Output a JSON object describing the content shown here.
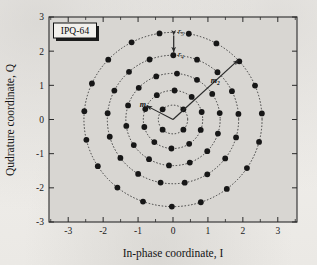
{
  "figure": {
    "badge_label": "IPQ-64",
    "axes": {
      "xlabel": "In-phase coordinate, I",
      "ylabel": "Qudrature coordinate, Q",
      "xticks": [
        -3,
        -2,
        -1,
        0,
        1,
        2,
        3
      ],
      "yticks": [
        -3,
        -2,
        -1,
        0,
        1,
        2,
        3
      ],
      "xtick_labels": [
        "-3",
        "-2",
        "-1",
        "0",
        "1",
        "2",
        "3"
      ],
      "ytick_labels": [
        "-3",
        "-2",
        "-1",
        "0",
        "1",
        "2",
        "3"
      ],
      "xlim": [
        -3.55,
        3.55
      ],
      "ylim": [
        -3.0,
        3.0
      ]
    },
    "annotations": [
      {
        "name": "r5",
        "base": "r",
        "sub": "5",
        "kind": "ring-spacing-upper"
      },
      {
        "name": "r4",
        "base": "r",
        "sub": "4",
        "kind": "ring-spacing-lower"
      },
      {
        "name": "m1",
        "base": "m",
        "sub": "1",
        "kind": "radius-vector-inner"
      },
      {
        "name": "m2",
        "base": "m",
        "sub": "2",
        "kind": "radius-vector-outer"
      }
    ],
    "colors": {
      "plot_background": "#d8d6d2",
      "frame": "#2b2b2b",
      "marker": "#171717",
      "ring": "#3a3a3a",
      "arrow": "#2a2a2a",
      "badge_fill": "#f2f0ec",
      "badge_shadow": "#1c1c1c"
    }
  },
  "chart_data": {
    "type": "scatter",
    "title": "IPQ-64",
    "xlabel": "In-phase coordinate, I",
    "ylabel": "Qudrature coordinate, Q",
    "xlim": [
      -3.55,
      3.55
    ],
    "ylim": [
      -3.0,
      3.0
    ],
    "grid": false,
    "legend": null,
    "rings": [
      {
        "index": 1,
        "radius": 0.42,
        "count": 4,
        "phase_deg": 45
      },
      {
        "index": 2,
        "radius": 0.85,
        "count": 10,
        "phase_deg": 15
      },
      {
        "index": 3,
        "radius": 1.35,
        "count": 14,
        "phase_deg": 8
      },
      {
        "index": 4,
        "radius": 1.88,
        "count": 17,
        "phase_deg": 5
      },
      {
        "index": 5,
        "radius": 2.55,
        "count": 19,
        "phase_deg": 4
      }
    ],
    "total_points": 64,
    "ring_spacing_labels": {
      "r4": 1.88,
      "r5": 2.55
    },
    "vector_labels": {
      "m1": 0.85,
      "m2": 2.55
    }
  }
}
